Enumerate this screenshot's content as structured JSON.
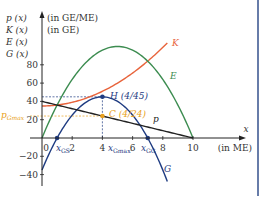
{
  "chart_data": {
    "type": "line",
    "title": "",
    "xlabel": "x (in ME)",
    "ylabel": "p(x) (in GE/ME), K(x), E(x), G(x) (in GE)",
    "ylabel_lines": [
      "p (x)",
      "K (x)",
      "E (x)",
      "G (x)"
    ],
    "ylabel_units": [
      "(in GE/ME)",
      "(in GE)"
    ],
    "x_axis_name": "x",
    "x_unit": "(in ME)",
    "xlim": [
      0,
      10
    ],
    "ylim": [
      -40,
      100
    ],
    "x_ticks": [
      0,
      2,
      4,
      6,
      8,
      10
    ],
    "y_ticks": [
      -40,
      -20,
      20,
      40,
      60,
      80
    ],
    "grid": false,
    "series": [
      {
        "name": "K",
        "formula": "x^2 + 35",
        "color": "#e8643c",
        "x_range": [
          0,
          8.3
        ],
        "x": [
          0,
          2,
          4,
          6,
          8
        ],
        "values": [
          35,
          39,
          51,
          71,
          99
        ]
      },
      {
        "name": "E",
        "formula": "-4x^2 + 40x",
        "color": "#3c8c50",
        "x_range": [
          0,
          10
        ],
        "x": [
          0,
          2,
          4,
          5,
          6,
          8,
          10
        ],
        "values": [
          0,
          64,
          96,
          100,
          96,
          64,
          0
        ]
      },
      {
        "name": "G",
        "formula": "-5x^2 + 40x - 35",
        "color": "#1f3c82",
        "x_range": [
          0,
          8.3
        ],
        "x": [
          0,
          1,
          2,
          4,
          6,
          7,
          8
        ],
        "values": [
          -35,
          0,
          25,
          45,
          25,
          0,
          -35
        ]
      },
      {
        "name": "p",
        "formula": "-4x + 40",
        "color": "#222222",
        "x_range": [
          0,
          10
        ],
        "x": [
          0,
          4,
          10
        ],
        "values": [
          40,
          24,
          0
        ]
      }
    ],
    "annotations": [
      {
        "label": "H(4/45)",
        "x": 4,
        "y": 45,
        "color": "#1f3c82"
      },
      {
        "label": "C(4/24)",
        "x": 4,
        "y": 24,
        "color": "#e8a020"
      },
      {
        "label": "x_GS",
        "x": 1,
        "y": 0,
        "color": "#1f3c82"
      },
      {
        "label": "x_Gmax",
        "x": 4,
        "y": 0,
        "color": "#1f3c82"
      },
      {
        "label": "x_GG",
        "x": 7,
        "y": 0,
        "color": "#1f3c82"
      },
      {
        "label": "p_Gmax",
        "y": 24,
        "color": "#e8a020"
      }
    ]
  },
  "labels": {
    "y_line1": "p (x)",
    "y_line2": "K (x)",
    "y_line3": "E (x)",
    "y_line4": "G (x)",
    "y_unit1": "(in GE/ME)",
    "y_unit2": "(in GE)",
    "x_name": "x",
    "x_unit": "(in ME)",
    "K": "K",
    "E": "E",
    "G": "G",
    "p": "p",
    "H": "H (4/45)",
    "C": "C (4/24)",
    "p_gmax": "p",
    "p_gmax_sub": "Gmax",
    "xgs": "x",
    "xgs_sub": "GS",
    "xgmax": "x",
    "xgmax_sub": "Gmax",
    "xgg": "x",
    "xgg_sub": "GG",
    "ticks_x": [
      "0",
      "2",
      "4",
      "6",
      "8",
      "10"
    ],
    "ticks_y": [
      "80",
      "60",
      "40",
      "20",
      "−20",
      "−40"
    ]
  }
}
